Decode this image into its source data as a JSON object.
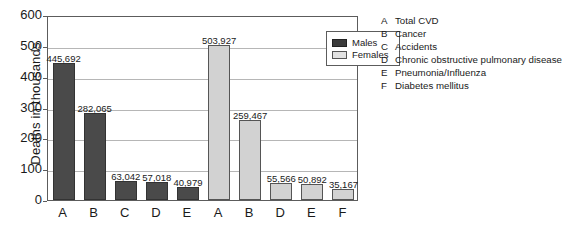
{
  "chart_data": {
    "type": "bar",
    "title": "",
    "xlabel": "",
    "ylabel": "Deaths in thousands",
    "ylim": [
      0,
      600
    ],
    "yticks": [
      0,
      100,
      200,
      300,
      400,
      500,
      600
    ],
    "grid": true,
    "legend_position": "top-right inside plot",
    "groups": [
      {
        "name": "Males",
        "categories": [
          "A",
          "B",
          "C",
          "D",
          "E"
        ],
        "values": [
          445692,
          282065,
          63042,
          57018,
          40979
        ],
        "value_labels": [
          "445,692",
          "282,065",
          "63,042",
          "57,018",
          "40,979"
        ]
      },
      {
        "name": "Females",
        "categories": [
          "A",
          "B",
          "D",
          "E",
          "F"
        ],
        "values": [
          503927,
          259467,
          55566,
          50892,
          35167
        ],
        "value_labels": [
          "503,927",
          "259,467",
          "55,566",
          "50,892",
          "35,167"
        ]
      }
    ]
  },
  "legend": {
    "items": [
      {
        "label": "Males",
        "color": "#3b3b3b"
      },
      {
        "label": "Females",
        "color": "#e2e2e2"
      }
    ]
  },
  "key": {
    "entries": [
      {
        "letter": "A",
        "text": "Total CVD"
      },
      {
        "letter": "B",
        "text": "Cancer"
      },
      {
        "letter": "C",
        "text": "Accidents"
      },
      {
        "letter": "D",
        "text": "Chronic obstructive pulmonary disease"
      },
      {
        "letter": "E",
        "text": "Pneumonia/Influenza"
      },
      {
        "letter": "F",
        "text": "Diabetes mellitus"
      }
    ]
  }
}
